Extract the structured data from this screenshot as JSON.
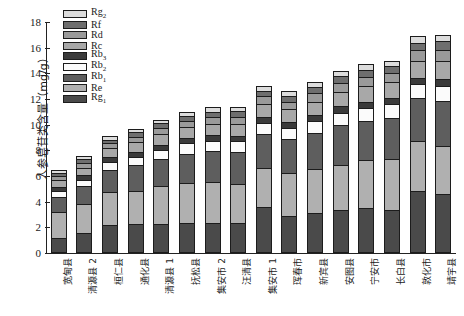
{
  "chart_data": {
    "type": "bar",
    "stacked": true,
    "title": "",
    "xlabel": "",
    "ylabel": "人参皂苷类含量（mg/g）",
    "ylim": [
      0,
      18
    ],
    "ytick_labels": [
      "0",
      "2",
      "4",
      "6",
      "8",
      "10",
      "12",
      "14",
      "16",
      "18"
    ],
    "ytick_values": [
      0,
      2,
      4,
      6,
      8,
      10,
      12,
      14,
      16,
      18
    ],
    "grid": false,
    "legend_position": "top-left",
    "categories": [
      "宽甸县",
      "清源县 2",
      "桓仁县",
      "通化县",
      "清源县 1",
      "抚松县",
      "集安市 2",
      "汪清县",
      "集安市 1",
      "珲春市",
      "新宾县",
      "安图县",
      "宁安市",
      "长白县",
      "敦化市",
      "靖宇县"
    ],
    "series": [
      {
        "name": "Rg1",
        "label_base": "Rg",
        "label_sub": "1",
        "color": "#4a4a4a",
        "values": [
          1.15,
          1.55,
          2.15,
          2.25,
          2.25,
          2.35,
          2.35,
          2.35,
          3.55,
          2.9,
          3.1,
          3.35,
          3.5,
          3.35,
          4.85,
          4.6
        ]
      },
      {
        "name": "Re",
        "label_base": "Re",
        "label_sub": "",
        "color": "#b0b0b0",
        "values": [
          2.05,
          2.3,
          2.6,
          2.6,
          3.0,
          3.1,
          3.2,
          3.0,
          3.1,
          3.3,
          3.45,
          3.5,
          3.75,
          4.0,
          3.85,
          3.75
        ]
      },
      {
        "name": "Rb1",
        "label_base": "Rb",
        "label_sub": "1",
        "color": "#5e5e5e",
        "values": [
          1.2,
          1.35,
          1.75,
          2.0,
          2.1,
          2.3,
          2.4,
          2.5,
          2.6,
          2.65,
          2.8,
          3.1,
          3.05,
          3.2,
          3.35,
          3.5
        ]
      },
      {
        "name": "Rb2",
        "label_base": "Rb",
        "label_sub": "2",
        "color": "#fbfbfb",
        "values": [
          0.45,
          0.5,
          0.6,
          0.65,
          0.7,
          0.8,
          0.8,
          0.85,
          0.9,
          0.9,
          0.95,
          1.0,
          1.0,
          1.05,
          1.1,
          1.2
        ]
      },
      {
        "name": "Rb3",
        "label_base": "Rb",
        "label_sub": "3",
        "color": "#3a3a3a",
        "values": [
          0.32,
          0.35,
          0.35,
          0.38,
          0.4,
          0.4,
          0.42,
          0.42,
          0.45,
          0.45,
          0.45,
          0.48,
          0.5,
          0.5,
          0.5,
          0.55
        ]
      },
      {
        "name": "Rc",
        "label_base": "Rc",
        "label_sub": "",
        "color": "#a8a8a8",
        "values": [
          0.55,
          0.6,
          0.7,
          0.75,
          0.8,
          0.85,
          0.9,
          0.95,
          1.0,
          1.0,
          1.05,
          1.15,
          1.2,
          1.2,
          1.35,
          1.4
        ]
      },
      {
        "name": "Rd",
        "label_base": "Rd",
        "label_sub": "",
        "color": "#9a9a9a",
        "values": [
          0.3,
          0.35,
          0.4,
          0.45,
          0.5,
          0.5,
          0.55,
          0.55,
          0.6,
          0.6,
          0.65,
          0.7,
          0.7,
          0.7,
          0.8,
          0.85
        ]
      },
      {
        "name": "Rf",
        "label_base": "Rf",
        "label_sub": "",
        "color": "#6e6e6e",
        "values": [
          0.25,
          0.3,
          0.3,
          0.35,
          0.35,
          0.4,
          0.4,
          0.42,
          0.45,
          0.45,
          0.5,
          0.5,
          0.55,
          0.55,
          0.6,
          0.65
        ]
      },
      {
        "name": "Rg2",
        "label_base": "Rg",
        "label_sub": "2",
        "color": "#dcdcdc",
        "values": [
          0.23,
          0.25,
          0.25,
          0.27,
          0.3,
          0.3,
          0.33,
          0.36,
          0.35,
          0.35,
          0.35,
          0.42,
          0.45,
          0.45,
          0.5,
          0.5
        ]
      }
    ],
    "legend_order": [
      "Rg2",
      "Rf",
      "Rd",
      "Rc",
      "Rb3",
      "Rb2",
      "Rb1",
      "Re",
      "Rg1"
    ]
  }
}
